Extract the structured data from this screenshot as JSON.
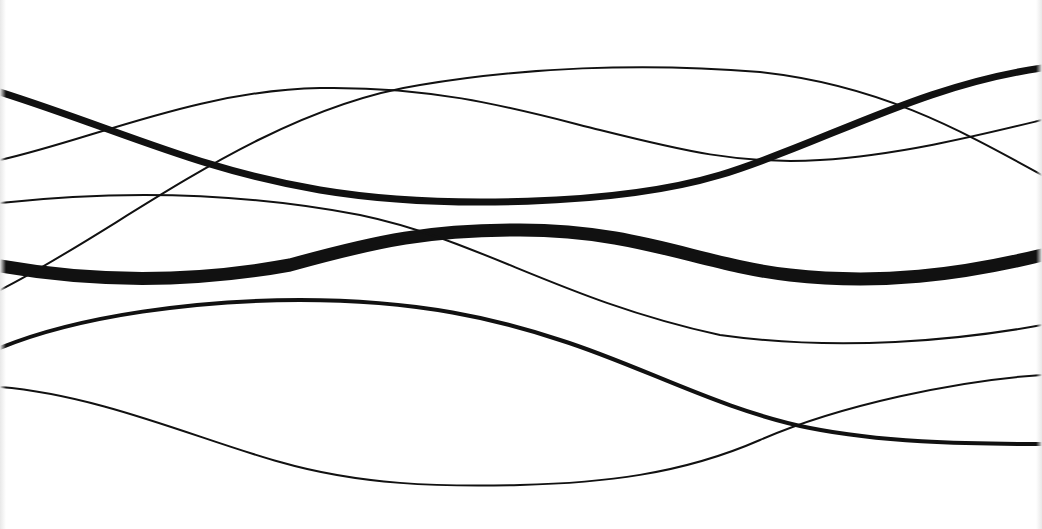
{
  "image": {
    "description": "Abstract line art: black wavy curves crossing horizontally on a white background",
    "width": 1042,
    "height": 529,
    "background_color": "#ffffff",
    "stroke_color": "#111111"
  },
  "curves": [
    {
      "name": "thick-upper-wave",
      "width": 7,
      "d": "M0,92 C120,130 200,170 320,190 C440,210 620,205 720,175 C820,145 920,85 1042,68"
    },
    {
      "name": "thick-middle-wave",
      "width": 13,
      "d": "M0,266 C80,280 180,285 290,265 C380,240 430,230 520,230 C640,230 700,265 790,275 C880,285 960,275 1042,255"
    },
    {
      "name": "thin-arch-top",
      "width": 2,
      "d": "M0,290 C120,230 260,110 420,85 C520,68 640,62 760,72 C880,85 960,130 1042,175"
    },
    {
      "name": "thin-upper-s",
      "width": 2,
      "d": "M0,160 C90,140 200,90 320,88 C440,86 520,110 600,130 C680,150 740,165 820,160 C900,155 980,135 1042,120"
    },
    {
      "name": "thin-middle-descending",
      "width": 2,
      "d": "M0,203 C120,190 240,192 360,215 C480,240 560,300 720,335 C840,352 960,340 1042,325"
    },
    {
      "name": "medium-lower-wave",
      "width": 4,
      "d": "M0,348 C80,315 200,300 300,300 C420,300 500,320 560,340 C640,365 720,410 810,428 C880,442 960,444 1042,444"
    },
    {
      "name": "thin-bottom-wave",
      "width": 2,
      "d": "M0,387 C100,395 200,440 280,462 C360,485 440,487 520,485 C600,483 680,475 760,440 C840,405 960,380 1042,375"
    }
  ]
}
